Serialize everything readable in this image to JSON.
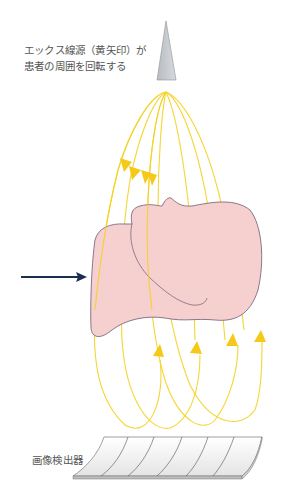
{
  "diagram": {
    "caption_line1": "エックス線源（黄矢印）が",
    "caption_line2": "患者の周囲を回転する",
    "detector_label": "画像検出器",
    "components": {
      "xray_source": "gray-triangle-xray-source",
      "beam_paths": "yellow-looping-arrows",
      "patient": "pink-head-profile",
      "direction_arrow": "navy-arrow-pointing-right",
      "detector": "curved-segmented-panel"
    },
    "colors": {
      "beam": "#f5d21e",
      "patient_fill": "#f6d0cf",
      "patient_outline": "#6d5a73",
      "arrow": "#1c2e52",
      "source_fill": "#c9ccd0",
      "detector_fill": "#f2f2f2",
      "detector_edge": "#777777"
    },
    "detector_segments": 6
  }
}
